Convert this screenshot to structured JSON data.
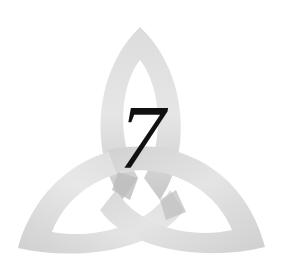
{
  "image": {
    "subject": "triquetra-knot",
    "numeral": "7",
    "colors": {
      "background": "#ffffff",
      "band_light": "#ececec",
      "band_mid": "#d4d4d4",
      "band_dark": "#bdbdbd",
      "numeral": "#111111"
    }
  }
}
